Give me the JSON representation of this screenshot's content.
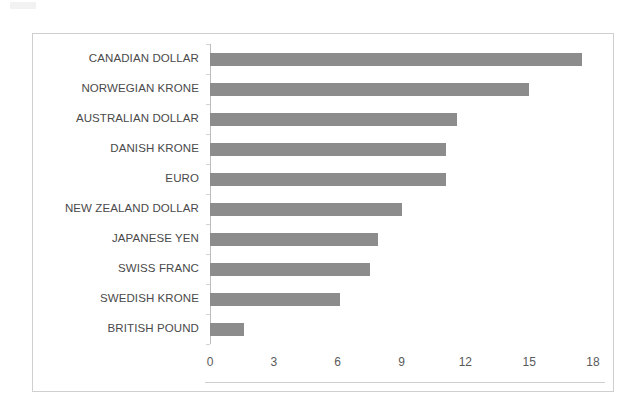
{
  "chart_data": {
    "type": "bar",
    "orientation": "horizontal",
    "title": "",
    "subtitle": "",
    "xlabel": "",
    "ylabel": "",
    "xlim": [
      0,
      18
    ],
    "ylim": null,
    "grid": false,
    "legend": null,
    "legend_position": "none",
    "bar_color": "#8c8c8c",
    "frame_color": "#cfcfcf",
    "axis_color": "#bdbdbd",
    "label_color": "#4a4a4a",
    "tick_label_color": "#5a5a5a",
    "xticks": [
      "0",
      "3",
      "6",
      "9",
      "12",
      "15",
      "18"
    ],
    "xtick_values": [
      0,
      3,
      6,
      9,
      12,
      15,
      18
    ],
    "categories": [
      "CANADIAN DOLLAR",
      "NORWEGIAN KRONE",
      "AUSTRALIAN DOLLAR",
      "DANISH KRONE",
      "EURO",
      "NEW ZEALAND DOLLAR",
      "JAPANESE YEN",
      "SWISS FRANC",
      "SWEDISH KRONE",
      "BRITISH POUND"
    ],
    "values": [
      17.5,
      15.0,
      11.6,
      11.1,
      11.1,
      9.0,
      7.9,
      7.5,
      6.1,
      1.6
    ],
    "annotations": []
  }
}
